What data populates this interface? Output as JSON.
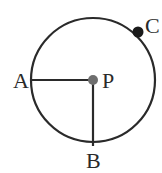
{
  "diagram": {
    "type": "circle-with-radii",
    "center": {
      "label": "P",
      "x": 93,
      "y": 80,
      "color": "#6e6e6e"
    },
    "radius": 62,
    "points": [
      {
        "label": "A",
        "x": 31,
        "y": 80
      },
      {
        "label": "B",
        "x": 93,
        "y": 142
      },
      {
        "label": "C",
        "x": 139,
        "y": 32,
        "color": "#1a1a1a"
      }
    ],
    "segments": [
      {
        "from": "A",
        "to": "P"
      },
      {
        "from": "P",
        "to": "B"
      }
    ],
    "stroke_color": "#2a2a2a"
  }
}
